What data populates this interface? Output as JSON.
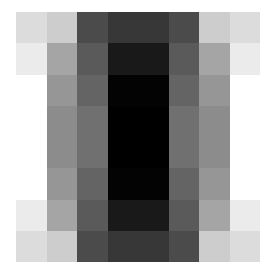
{
  "chart_data": {
    "type": "heatmap",
    "title": "",
    "xlabel": "",
    "ylabel": "",
    "colormap": "grayscale (0 = black, 255 = white)",
    "grid": false,
    "legend": null,
    "rows": 8,
    "cols": 8,
    "values": [
      [
        220,
        205,
        75,
        55,
        55,
        75,
        205,
        220
      ],
      [
        235,
        165,
        90,
        25,
        25,
        90,
        165,
        235
      ],
      [
        255,
        150,
        100,
        3,
        3,
        100,
        150,
        255
      ],
      [
        255,
        140,
        112,
        0,
        0,
        112,
        140,
        255
      ],
      [
        255,
        140,
        112,
        0,
        0,
        112,
        140,
        255
      ],
      [
        255,
        150,
        100,
        3,
        3,
        100,
        150,
        255
      ],
      [
        235,
        165,
        90,
        25,
        25,
        90,
        165,
        235
      ],
      [
        220,
        205,
        75,
        55,
        55,
        75,
        205,
        220
      ]
    ]
  }
}
